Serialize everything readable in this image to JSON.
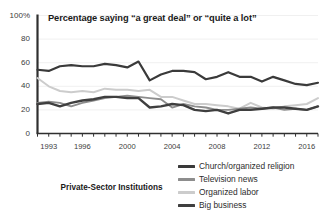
{
  "chart_data": {
    "type": "line",
    "title": "Percentage saying “a great deal” or “quite a lot”",
    "panel_label": "Private-Sector Institutions",
    "xlabel": "",
    "ylabel": "",
    "ylim": [
      0,
      100
    ],
    "xlim": [
      1992,
      2017
    ],
    "grid": true,
    "legend_position": "bottom-right",
    "ytick_labels": [
      "100%",
      "80",
      "60",
      "40",
      "20",
      "0"
    ],
    "ytick_values": [
      100,
      80,
      60,
      40,
      20,
      0
    ],
    "xtick_labels": [
      "1993",
      "1996",
      "2000",
      "2004",
      "2008",
      "2012",
      "2016"
    ],
    "xtick_values": [
      1993,
      1996,
      2000,
      2004,
      2008,
      2012,
      2016
    ],
    "x": [
      1992,
      1993,
      1994,
      1995,
      1996,
      1997,
      1998,
      1999,
      2000,
      2001,
      2002,
      2003,
      2004,
      2005,
      2006,
      2007,
      2008,
      2009,
      2010,
      2011,
      2012,
      2013,
      2014,
      2015,
      2016,
      2017
    ],
    "series": [
      {
        "name": "Church/organized religion",
        "color": "#3a3a3a",
        "width": 2.2,
        "values": [
          54,
          53,
          57,
          58,
          57,
          57,
          59,
          58,
          56,
          61,
          45,
          50,
          53,
          53,
          52,
          46,
          48,
          52,
          48,
          48,
          44,
          48,
          45,
          42,
          41,
          43
        ]
      },
      {
        "name": "Television news",
        "color": "#8d8d8d",
        "width": 1.9,
        "values": [
          26,
          27,
          26,
          23,
          26,
          28,
          30,
          31,
          32,
          31,
          30,
          29,
          22,
          25,
          23,
          22,
          20,
          20,
          21,
          22,
          21,
          22,
          20,
          21,
          20,
          23
        ]
      },
      {
        "name": "Organized labor",
        "color": "#cccccc",
        "width": 2.0,
        "values": [
          47,
          40,
          36,
          35,
          36,
          35,
          38,
          37,
          37,
          36,
          37,
          31,
          31,
          28,
          25,
          25,
          24,
          23,
          21,
          26,
          22,
          21,
          23,
          24,
          25,
          30
        ]
      },
      {
        "name": "Big business",
        "color": "#3f3f3f",
        "width": 2.4,
        "values": [
          25,
          26,
          23,
          26,
          28,
          29,
          31,
          31,
          30,
          30,
          22,
          23,
          25,
          24,
          20,
          19,
          20,
          17,
          20,
          20,
          21,
          22,
          22,
          21,
          20,
          23
        ]
      }
    ]
  }
}
